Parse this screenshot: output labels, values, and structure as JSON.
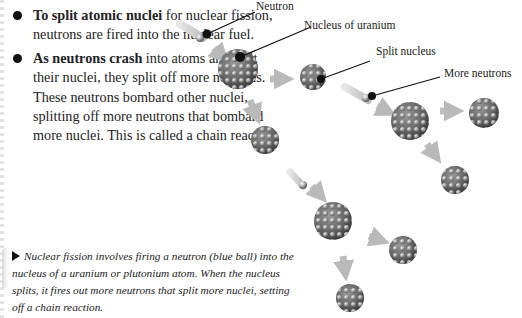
{
  "bullets": [
    {
      "bold": "To split atomic nuclei",
      "text": " for nuclear fission, neutrons are fired into the nuclear fuel."
    },
    {
      "bold": "As neutrons crash",
      "text": " into atoms and split their nuclei, they split off more neutrons. These neutrons bombard other nuclei, splitting off more neutrons that bombard more nuclei. This is called a chain reaction."
    }
  ],
  "caption": "Nuclear fission involves firing a neutron (blue ball) into the nucleus of a uranium or plutonium atom. When the nucleus splits, it fires out more neutrons that split more nuclei, setting off a chain reaction.",
  "labels": {
    "neutron": "Neutron",
    "nucleus_of_uranium": "Nucleus of uranium",
    "split_nucleus": "Split nucleus",
    "more_neutrons": "More neutrons"
  },
  "colors": {
    "arrow": "#b9b9b9",
    "nucleus": "#6f6f6f",
    "leader_line": "#111111"
  }
}
